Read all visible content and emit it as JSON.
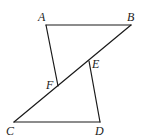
{
  "diagram": {
    "type": "geometry",
    "points": {
      "A": {
        "label": "A",
        "x": 46,
        "y": 25,
        "lx": 38,
        "ly": 21
      },
      "B": {
        "label": "B",
        "x": 131,
        "y": 25,
        "lx": 127,
        "ly": 21
      },
      "C": {
        "label": "C",
        "x": 14,
        "y": 122,
        "lx": 6,
        "ly": 135
      },
      "D": {
        "label": "D",
        "x": 100,
        "y": 122,
        "lx": 95,
        "ly": 135
      },
      "E": {
        "label": "E",
        "x": 89,
        "y": 61,
        "lx": 92,
        "ly": 68
      },
      "F": {
        "label": "F",
        "x": 58,
        "y": 86,
        "lx": 46,
        "ly": 89
      }
    },
    "segments": [
      {
        "from": "A",
        "to": "B"
      },
      {
        "from": "A",
        "to": "F"
      },
      {
        "from": "B",
        "to": "C"
      },
      {
        "from": "C",
        "to": "D"
      },
      {
        "from": "D",
        "to": "E"
      }
    ],
    "line_color": "#1a1a1a",
    "label_color": "#222222"
  }
}
